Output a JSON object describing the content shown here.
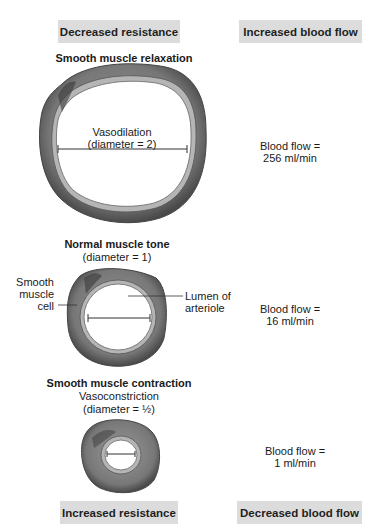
{
  "top": {
    "left_box": "Decreased resistance",
    "right_box": "Increased blood flow"
  },
  "bottom": {
    "left_box": "Increased resistance",
    "right_box": "Decreased blood flow"
  },
  "vessels": [
    {
      "title": "Smooth muscle relaxation",
      "label_line1": "Vasodilation",
      "label_line2": "(diameter = 2)",
      "flow_line1": "Blood flow =",
      "flow_line2": "256 ml/min"
    },
    {
      "title": "Normal muscle tone",
      "subtitle": "(diameter = 1)",
      "flow_line1": "Blood flow =",
      "flow_line2": "16 ml/min",
      "callout_left_1": "Smooth",
      "callout_left_2": "muscle",
      "callout_left_3": "cell",
      "callout_right_1": "Lumen of",
      "callout_right_2": "arteriole"
    },
    {
      "title": "Smooth muscle contraction",
      "subtitle1": "Vasoconstriction",
      "subtitle2": "(diameter = ½)",
      "flow_line1": "Blood flow =",
      "flow_line2": "1 ml/min"
    }
  ],
  "colors": {
    "box_bg": "#dcdcdc",
    "vessel_wall": "#6e6e6e",
    "vessel_inner": "#a8a8a8"
  }
}
